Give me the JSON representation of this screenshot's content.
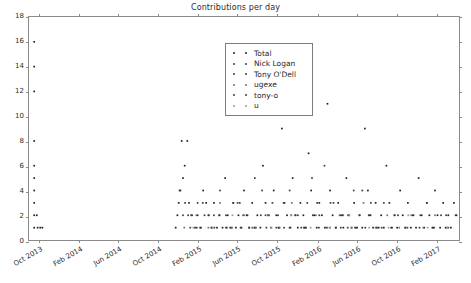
{
  "chart_data": {
    "type": "scatter",
    "title": "Contributions per day",
    "xlabel": "",
    "ylabel": "",
    "grid": false,
    "legend_position": "upper center",
    "ylim": [
      0,
      18
    ],
    "yticks": [
      0,
      2,
      4,
      6,
      8,
      10,
      12,
      14,
      16,
      18
    ],
    "ytick_labels": [
      "0",
      "2",
      "4",
      "6",
      "8",
      "10",
      "12",
      "14",
      "16",
      "18"
    ],
    "xlim": [
      "2013-09-01",
      "2017-04-15"
    ],
    "xticks": [
      "2013-10-01",
      "2014-02-01",
      "2014-06-01",
      "2014-10-01",
      "2015-02-01",
      "2015-06-01",
      "2015-10-01",
      "2016-02-01",
      "2016-06-01",
      "2016-10-01",
      "2017-02-01"
    ],
    "xtick_labels": [
      "Oct 2013",
      "Feb 2014",
      "Jun 2014",
      "Oct 2014",
      "Feb 2015",
      "Jun 2015",
      "Oct 2015",
      "Feb 2016",
      "Jun 2016",
      "Oct 2016",
      "Feb 2017"
    ],
    "marker": "point",
    "marker_size": 1.6,
    "series": [
      {
        "name": "Total",
        "color": "#1f1f1f",
        "points": [
          [
            0.012,
            16
          ],
          [
            0.012,
            14
          ],
          [
            0.012,
            12
          ],
          [
            0.012,
            8
          ],
          [
            0.012,
            6
          ],
          [
            0.012,
            5
          ],
          [
            0.012,
            4
          ],
          [
            0.012,
            3
          ],
          [
            0.012,
            2
          ],
          [
            0.012,
            1
          ],
          [
            0.02,
            1
          ],
          [
            0.026,
            1
          ],
          [
            0.031,
            1
          ],
          [
            0.018,
            2
          ],
          [
            0.355,
            8
          ],
          [
            0.368,
            8
          ],
          [
            0.362,
            6
          ],
          [
            0.358,
            5
          ],
          [
            0.352,
            4
          ],
          [
            0.348,
            3
          ],
          [
            0.345,
            2
          ],
          [
            0.341,
            1
          ],
          [
            0.372,
            3
          ],
          [
            0.379,
            2
          ],
          [
            0.386,
            1
          ],
          [
            0.392,
            2
          ],
          [
            0.398,
            1
          ],
          [
            0.405,
            4
          ],
          [
            0.412,
            3
          ],
          [
            0.418,
            2
          ],
          [
            0.424,
            1
          ],
          [
            0.43,
            3
          ],
          [
            0.437,
            1
          ],
          [
            0.443,
            2
          ],
          [
            0.45,
            1
          ],
          [
            0.456,
            5
          ],
          [
            0.462,
            2
          ],
          [
            0.468,
            1
          ],
          [
            0.475,
            3
          ],
          [
            0.481,
            1
          ],
          [
            0.487,
            2
          ],
          [
            0.494,
            1
          ],
          [
            0.5,
            4
          ],
          [
            0.506,
            2
          ],
          [
            0.512,
            1
          ],
          [
            0.519,
            3
          ],
          [
            0.525,
            1
          ],
          [
            0.531,
            2
          ],
          [
            0.538,
            1
          ],
          [
            0.544,
            6
          ],
          [
            0.55,
            3
          ],
          [
            0.556,
            2
          ],
          [
            0.563,
            1
          ],
          [
            0.569,
            4
          ],
          [
            0.575,
            2
          ],
          [
            0.581,
            1
          ],
          [
            0.588,
            9
          ],
          [
            0.594,
            3
          ],
          [
            0.6,
            2
          ],
          [
            0.606,
            1
          ],
          [
            0.613,
            5
          ],
          [
            0.619,
            2
          ],
          [
            0.625,
            1
          ],
          [
            0.631,
            3
          ],
          [
            0.638,
            2
          ],
          [
            0.644,
            1
          ],
          [
            0.65,
            7
          ],
          [
            0.656,
            4
          ],
          [
            0.663,
            2
          ],
          [
            0.669,
            1
          ],
          [
            0.675,
            3
          ],
          [
            0.681,
            2
          ],
          [
            0.688,
            1
          ],
          [
            0.694,
            11
          ],
          [
            0.7,
            4
          ],
          [
            0.706,
            2
          ],
          [
            0.713,
            1
          ],
          [
            0.719,
            3
          ],
          [
            0.725,
            2
          ],
          [
            0.731,
            1
          ],
          [
            0.738,
            5
          ],
          [
            0.744,
            2
          ],
          [
            0.75,
            1
          ],
          [
            0.756,
            3
          ],
          [
            0.763,
            1
          ],
          [
            0.769,
            2
          ],
          [
            0.775,
            1
          ],
          [
            0.781,
            9
          ],
          [
            0.788,
            4
          ],
          [
            0.794,
            2
          ],
          [
            0.8,
            1
          ],
          [
            0.806,
            3
          ],
          [
            0.813,
            1
          ],
          [
            0.819,
            2
          ],
          [
            0.825,
            1
          ],
          [
            0.831,
            6
          ],
          [
            0.838,
            3
          ],
          [
            0.844,
            1
          ],
          [
            0.85,
            2
          ],
          [
            0.856,
            1
          ],
          [
            0.863,
            4
          ],
          [
            0.869,
            2
          ],
          [
            0.875,
            1
          ],
          [
            0.881,
            3
          ],
          [
            0.888,
            1
          ],
          [
            0.894,
            2
          ],
          [
            0.9,
            1
          ],
          [
            0.906,
            5
          ],
          [
            0.913,
            2
          ],
          [
            0.919,
            1
          ],
          [
            0.925,
            3
          ],
          [
            0.931,
            2
          ],
          [
            0.938,
            1
          ],
          [
            0.944,
            4
          ],
          [
            0.95,
            2
          ],
          [
            0.956,
            1
          ],
          [
            0.963,
            3
          ],
          [
            0.969,
            1
          ],
          [
            0.975,
            2
          ],
          [
            0.981,
            1
          ],
          [
            0.988,
            3
          ],
          [
            0.994,
            2
          ]
        ]
      },
      {
        "name": "Nick Logan",
        "color": "#3c3c3c",
        "points": [
          [
            0.35,
            4
          ],
          [
            0.363,
            3
          ],
          [
            0.377,
            2
          ],
          [
            0.39,
            1
          ],
          [
            0.404,
            3
          ],
          [
            0.417,
            2
          ],
          [
            0.431,
            1
          ],
          [
            0.444,
            4
          ],
          [
            0.458,
            2
          ],
          [
            0.471,
            1
          ],
          [
            0.485,
            3
          ],
          [
            0.498,
            2
          ],
          [
            0.512,
            1
          ],
          [
            0.525,
            5
          ],
          [
            0.539,
            2
          ],
          [
            0.552,
            1
          ],
          [
            0.566,
            3
          ],
          [
            0.579,
            2
          ],
          [
            0.593,
            1
          ],
          [
            0.606,
            4
          ],
          [
            0.62,
            2
          ],
          [
            0.633,
            1
          ],
          [
            0.647,
            3
          ],
          [
            0.66,
            2
          ],
          [
            0.674,
            1
          ],
          [
            0.687,
            6
          ],
          [
            0.701,
            3
          ],
          [
            0.714,
            1
          ],
          [
            0.728,
            2
          ],
          [
            0.741,
            1
          ],
          [
            0.755,
            4
          ],
          [
            0.768,
            2
          ],
          [
            0.782,
            1
          ],
          [
            0.795,
            3
          ],
          [
            0.809,
            1
          ]
        ]
      },
      {
        "name": "Tony O'Dell",
        "color": "#3c3c3c",
        "points": [
          [
            0.358,
            2
          ],
          [
            0.375,
            1
          ],
          [
            0.392,
            3
          ],
          [
            0.408,
            2
          ],
          [
            0.425,
            1
          ],
          [
            0.442,
            2
          ],
          [
            0.458,
            1
          ],
          [
            0.475,
            3
          ],
          [
            0.492,
            1
          ],
          [
            0.508,
            2
          ],
          [
            0.525,
            1
          ],
          [
            0.542,
            4
          ],
          [
            0.558,
            2
          ],
          [
            0.575,
            1
          ],
          [
            0.592,
            3
          ],
          [
            0.608,
            1
          ],
          [
            0.625,
            2
          ],
          [
            0.642,
            1
          ],
          [
            0.658,
            5
          ],
          [
            0.675,
            2
          ],
          [
            0.692,
            1
          ],
          [
            0.708,
            3
          ],
          [
            0.725,
            1
          ],
          [
            0.742,
            2
          ],
          [
            0.758,
            1
          ],
          [
            0.775,
            4
          ],
          [
            0.792,
            2
          ],
          [
            0.808,
            1
          ],
          [
            0.825,
            3
          ],
          [
            0.842,
            1
          ],
          [
            0.858,
            2
          ],
          [
            0.875,
            1
          ],
          [
            0.892,
            2
          ],
          [
            0.908,
            1
          ],
          [
            0.925,
            3
          ],
          [
            0.942,
            1
          ],
          [
            0.958,
            2
          ],
          [
            0.975,
            1
          ],
          [
            0.992,
            2
          ]
        ]
      },
      {
        "name": "ugexe",
        "color": "#6e6e6e",
        "points": [
          [
            0.361,
            1
          ],
          [
            0.389,
            2
          ],
          [
            0.417,
            1
          ],
          [
            0.444,
            3
          ],
          [
            0.472,
            1
          ],
          [
            0.5,
            2
          ],
          [
            0.528,
            1
          ],
          [
            0.556,
            2
          ],
          [
            0.583,
            1
          ],
          [
            0.611,
            3
          ],
          [
            0.639,
            1
          ],
          [
            0.667,
            2
          ],
          [
            0.694,
            1
          ],
          [
            0.722,
            2
          ],
          [
            0.75,
            1
          ],
          [
            0.778,
            3
          ],
          [
            0.806,
            1
          ],
          [
            0.833,
            2
          ],
          [
            0.861,
            1
          ],
          [
            0.889,
            2
          ],
          [
            0.917,
            1
          ],
          [
            0.944,
            2
          ],
          [
            0.972,
            1
          ]
        ]
      },
      {
        "name": "tony-o",
        "color": "#3c3c3c",
        "points": [
          [
            0.37,
            2
          ],
          [
            0.4,
            1
          ],
          [
            0.43,
            2
          ],
          [
            0.46,
            1
          ],
          [
            0.49,
            3
          ],
          [
            0.52,
            1
          ],
          [
            0.55,
            2
          ],
          [
            0.58,
            1
          ],
          [
            0.61,
            2
          ],
          [
            0.64,
            1
          ],
          [
            0.67,
            3
          ],
          [
            0.7,
            1
          ],
          [
            0.73,
            2
          ],
          [
            0.76,
            1
          ],
          [
            0.79,
            2
          ],
          [
            0.82,
            1
          ],
          [
            0.85,
            2
          ],
          [
            0.88,
            1
          ],
          [
            0.91,
            2
          ],
          [
            0.94,
            1
          ],
          [
            0.97,
            2
          ]
        ]
      },
      {
        "name": "u",
        "color": "#9a9a9a",
        "points": [
          [
            0.382,
            1
          ],
          [
            0.427,
            1
          ],
          [
            0.473,
            2
          ],
          [
            0.518,
            1
          ],
          [
            0.564,
            1
          ],
          [
            0.609,
            2
          ],
          [
            0.655,
            1
          ],
          [
            0.7,
            1
          ],
          [
            0.745,
            2
          ],
          [
            0.791,
            1
          ],
          [
            0.836,
            1
          ],
          [
            0.882,
            2
          ],
          [
            0.927,
            1
          ],
          [
            0.973,
            1
          ]
        ]
      }
    ]
  },
  "legend": {
    "entries": [
      {
        "label": "Total"
      },
      {
        "label": "Nick Logan"
      },
      {
        "label": "Tony O'Dell"
      },
      {
        "label": "ugexe"
      },
      {
        "label": "tony-o"
      },
      {
        "label": "u"
      }
    ]
  },
  "colors": {
    "axis": "#8a8a8a",
    "text": "#2b2b2b",
    "background": "#ffffff"
  }
}
